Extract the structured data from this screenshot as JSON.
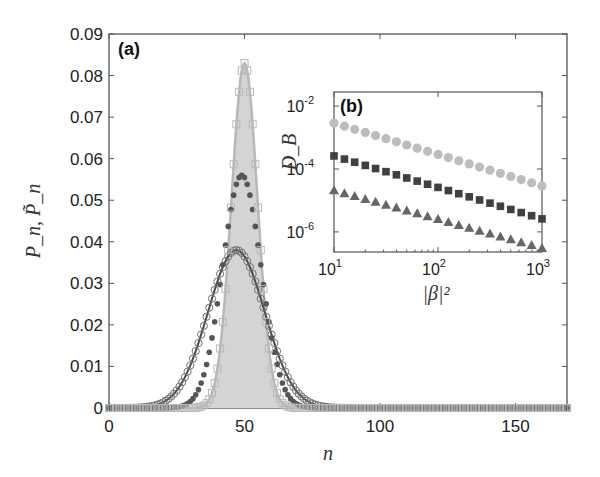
{
  "figure": {
    "panel_a_label": "(a)",
    "panel_b_label": "(b)",
    "colors": {
      "axis": "#555555",
      "squares": "#b8b8b8",
      "fill": "#d4d4d4",
      "dots": "#555555",
      "circles": "#707070",
      "inset_circles": "#bdbdbd",
      "inset_squares": "#404040",
      "inset_triangles": "#666666"
    }
  },
  "chart_data": [
    {
      "panel": "(a)",
      "type": "scatter",
      "title": "",
      "xlabel": "n",
      "ylabel": "P_n, P̃_n",
      "xlim": [
        0,
        169
      ],
      "ylim": [
        0,
        0.09
      ],
      "xticks": [
        0,
        50,
        100,
        150
      ],
      "xtick_labels": [
        "0",
        "50",
        "100",
        "150"
      ],
      "yticks": [
        0,
        0.01,
        0.02,
        0.03,
        0.04,
        0.05,
        0.06,
        0.07,
        0.08,
        0.09
      ],
      "ytick_labels": [
        "0",
        "0.01",
        "0.02",
        "0.03",
        "0.04",
        "0.05",
        "0.06",
        "0.07",
        "0.08",
        "0.09"
      ],
      "grid": false,
      "legend": null,
      "series": [
        {
          "name": "narrow distribution (open squares + light line, shaded)",
          "marker": "open-square",
          "peak_n": 50,
          "peak_value": 0.083,
          "sigma": 4.8
        },
        {
          "name": "intermediate distribution (filled dots)",
          "marker": "filled-circle",
          "peak_n": 49,
          "peak_value": 0.056,
          "sigma": 7.1
        },
        {
          "name": "broad distribution (open circles + dark line)",
          "marker": "open-circle",
          "peak_n": 47,
          "peak_value": 0.038,
          "sigma": 10.5
        }
      ]
    },
    {
      "panel": "(b)",
      "type": "scatter",
      "title": "",
      "xlabel": "|β|²",
      "ylabel": "D_B",
      "xscale": "log",
      "yscale": "log",
      "xlim": [
        10,
        1000
      ],
      "ylim": [
        2.3e-07,
        0.028
      ],
      "xtick_labels": [
        "10^1",
        "10^2",
        "10^3"
      ],
      "ytick_labels": [
        "10^-6",
        "10^-4",
        "10^-2"
      ],
      "x": [
        10,
        12.6,
        15.8,
        20,
        25.1,
        31.6,
        39.8,
        50.1,
        63.1,
        79.4,
        100,
        125.9,
        158.5,
        199.5,
        251.2,
        316.2,
        398.1,
        501.2,
        631,
        794.3,
        1000
      ],
      "series": [
        {
          "name": "light gray circles",
          "marker": "filled-circle",
          "start": 0.0029,
          "end": 2.9e-05,
          "slope": -1.0
        },
        {
          "name": "dark squares",
          "marker": "filled-square",
          "start": 0.00026,
          "end": 2.6e-06,
          "slope": -1.0
        },
        {
          "name": "gray triangles",
          "marker": "filled-triangle",
          "start": 2.1e-05,
          "end": 3.1e-07,
          "slope": -0.92
        }
      ]
    }
  ]
}
